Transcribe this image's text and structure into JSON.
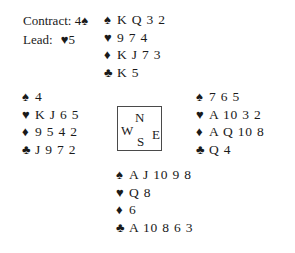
{
  "diagram": {
    "suit_symbols": {
      "spade": "♠",
      "heart": "♥",
      "diamond": "♦",
      "club": "♣"
    },
    "colors": {
      "ink": "#1a1a1a",
      "box_border": "#4a4a4a",
      "background": "#ffffff"
    }
  },
  "contract_info": {
    "contract_label": "Contract:",
    "contract_level": "4",
    "contract_suit_symbol": "♠",
    "contract_suit_name": "spade",
    "lead_label": "Lead:",
    "lead_suit_symbol": "♥",
    "lead_suit_name": "heart",
    "lead_rank": "5"
  },
  "compass": {
    "north": "N",
    "west": "W",
    "east": "E",
    "south": "S"
  },
  "hands": {
    "north": {
      "position": "North",
      "rows": [
        {
          "suit": "spade",
          "symbol": "♠",
          "cards": "K Q 3 2"
        },
        {
          "suit": "heart",
          "symbol": "♥",
          "cards": "9 7 4"
        },
        {
          "suit": "diamond",
          "symbol": "♦",
          "cards": "K J 7 3"
        },
        {
          "suit": "club",
          "symbol": "♣",
          "cards": "K 5"
        }
      ]
    },
    "west": {
      "position": "West",
      "rows": [
        {
          "suit": "spade",
          "symbol": "♠",
          "cards": "4"
        },
        {
          "suit": "heart",
          "symbol": "♥",
          "cards": "K J 6 5"
        },
        {
          "suit": "diamond",
          "symbol": "♦",
          "cards": "9 5 4 2"
        },
        {
          "suit": "club",
          "symbol": "♣",
          "cards": "J 9 7 2"
        }
      ]
    },
    "east": {
      "position": "East",
      "rows": [
        {
          "suit": "spade",
          "symbol": "♠",
          "cards": "7 6 5"
        },
        {
          "suit": "heart",
          "symbol": "♥",
          "cards": "A 10 3 2"
        },
        {
          "suit": "diamond",
          "symbol": "♦",
          "cards": "A Q 10 8"
        },
        {
          "suit": "club",
          "symbol": "♣",
          "cards": "Q 4"
        }
      ]
    },
    "south": {
      "position": "South",
      "rows": [
        {
          "suit": "spade",
          "symbol": "♠",
          "cards": "A J 10 9 8"
        },
        {
          "suit": "heart",
          "symbol": "♥",
          "cards": "Q 8"
        },
        {
          "suit": "diamond",
          "symbol": "♦",
          "cards": "6"
        },
        {
          "suit": "club",
          "symbol": "♣",
          "cards": "A 10 8 6 3"
        }
      ]
    }
  }
}
